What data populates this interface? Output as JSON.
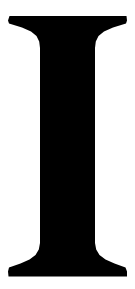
{
  "image": {
    "kind": "glyph-specimen",
    "width": 135,
    "height": 289,
    "background_color": "#ffffff"
  },
  "glyph": {
    "character": "I",
    "name": "latin-capital-letter-i",
    "description": "Serif capital letter I",
    "style": "slab-serif / didone",
    "fill_color": "#000000",
    "alt_text": "I",
    "metrics": {
      "left_extent": 8,
      "right_extent": 127,
      "top": 14,
      "bottom": 277,
      "stem_left": 43,
      "stem_right": 95,
      "stem_width": 52,
      "top_serif_bottom": 48,
      "bottom_serif_top": 245,
      "serif_width": 119,
      "cap_height": 263
    },
    "outline_path": "M 9.5 16.0 L 126.5 16.0 L 127.0 20.5 L 126.0 23.5 L 113.0 27.5 L 104.0 31.5 L 98.5 36.0 L 95.8 41.5 L 95.0 48.0 L 95.0 243.0 L 96.2 249.5 L 99.5 255.0 L 105.5 259.5 L 114.5 263.5 L 125.5 267.5 L 127.0 271.5 L 127.0 276.5 L 8.5 276.5 L 8.0 271.5 L 9.0 267.5 L 20.5 263.5 L 29.5 259.5 L 35.5 255.0 L 38.8 249.5 L 40.0 243.0 L 40.0 48.0 L 39.2 41.5 L 36.5 36.0 L 31.0 31.5 L 22.0 27.5 L 9.0 23.5 L 8.0 20.5 Z"
  }
}
